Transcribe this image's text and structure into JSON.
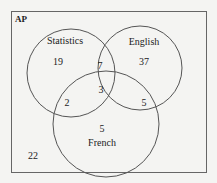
{
  "diagram": {
    "type": "venn",
    "universe_label": "AP",
    "sets": [
      {
        "name": "Statistics",
        "label": "Statistics"
      },
      {
        "name": "English",
        "label": "English"
      },
      {
        "name": "French",
        "label": "French"
      }
    ],
    "regions": {
      "statistics_only": "19",
      "english_only": "37",
      "french_only": "5",
      "statistics_english": "7",
      "statistics_french": "2",
      "english_french": "5",
      "all_three": "3",
      "none": "22"
    },
    "colors": {
      "background": "#f4f4f2",
      "stroke": "#555555",
      "text": "#222222"
    }
  }
}
